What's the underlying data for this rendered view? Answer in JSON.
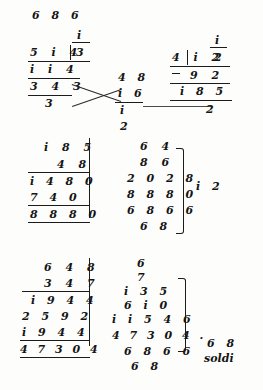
{
  "page": {
    "ink_color": "#141414",
    "paper_color": "#fdfdfc"
  },
  "top_header": {
    "digits": "6 8 6"
  },
  "division_left": {
    "quotient_above": "i",
    "dividend": "5 i 4",
    "divisor": "3",
    "subtrahend": "i i 4",
    "remainder_row": "3 4 3",
    "final": "3"
  },
  "division_middle": {
    "line1": "4 8",
    "line2": "i 6",
    "line3": "i",
    "line4": "2"
  },
  "division_right": {
    "quotient_above": "i",
    "dividend": "4 i 2",
    "divisor": "2",
    "subtrahend": "9 2",
    "remainder_row": "i 8 5",
    "final": "2"
  },
  "multiplication_left": {
    "multiplicand": "i 8 5",
    "multiplier": "4 8",
    "partial_1": "i 4 8 0",
    "partial_2": "7 4 0",
    "product": "8 8 8 0"
  },
  "column_middle": {
    "rows": [
      "6 4",
      "8 6",
      "2 0 2 8",
      "8 8 8 0",
      "6 8 6 6",
      "6 8"
    ],
    "bracket_result": "i 2"
  },
  "multiplication_bottom": {
    "multiplicand": "6 4 8",
    "multiplier": "3 4 7",
    "partial_1": "i 9 4 4",
    "partial_2": "2 5 9 2",
    "partial_3": "i 9 4 4",
    "product": "4 7 3 0 4"
  },
  "column_bottom": {
    "rows": [
      "6",
      "7",
      "i 3 5",
      "6 i 0",
      "i i 5 4 6",
      "4 7 3 0 4 .",
      "6 8 6 6",
      "6 8"
    ]
  },
  "result_note": {
    "value": "6 8",
    "unit": "soldi"
  }
}
